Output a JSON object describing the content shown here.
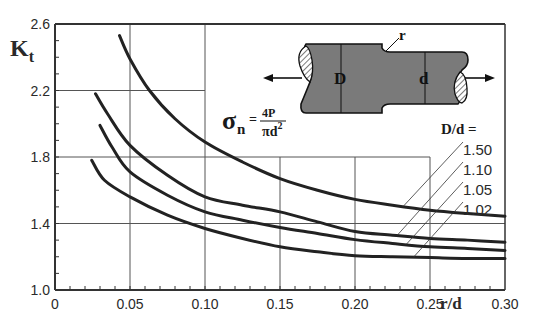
{
  "chart_data": {
    "type": "line",
    "title": "",
    "xlabel": "r/d",
    "ylabel": "K",
    "ylabel_subscript": "t",
    "xlim": [
      0,
      0.3
    ],
    "ylim": [
      1.0,
      2.6
    ],
    "x_ticks": [
      0,
      0.05,
      0.1,
      0.15,
      0.2,
      0.25,
      0.3
    ],
    "x_tick_labels": [
      "0",
      "0.05",
      "0.10",
      "0.15",
      "0.20",
      "0.25",
      "0.30"
    ],
    "y_ticks": [
      1.0,
      1.4,
      1.8,
      2.2,
      2.6
    ],
    "y_tick_labels": [
      "1.0",
      "1.4",
      "1.8",
      "2.2",
      "2.6"
    ],
    "x_minor_step": 0.01,
    "y_minor_step": 0.1,
    "grid": "partial",
    "gridlines": [
      {
        "orient": "v",
        "at": 0.05,
        "from": 1.0,
        "to": 2.6
      },
      {
        "orient": "v",
        "at": 0.1,
        "from": 1.0,
        "to": 2.6
      },
      {
        "orient": "v",
        "at": 0.15,
        "from": 1.0,
        "to": 1.8
      },
      {
        "orient": "v",
        "at": 0.2,
        "from": 1.0,
        "to": 1.8
      },
      {
        "orient": "v",
        "at": 0.25,
        "from": 1.0,
        "to": 1.8
      },
      {
        "orient": "h",
        "at": 2.2,
        "from": 0,
        "to": 0.1
      },
      {
        "orient": "h",
        "at": 1.8,
        "from": 0,
        "to": 0.25
      },
      {
        "orient": "h",
        "at": 1.4,
        "from": 0,
        "to": 0.3
      }
    ],
    "legend_title": "D/d =",
    "legend_placement": "right",
    "series": [
      {
        "name": "1.50",
        "points": [
          [
            0.043,
            2.53
          ],
          [
            0.05,
            2.39
          ],
          [
            0.063,
            2.2
          ],
          [
            0.08,
            2.03
          ],
          [
            0.1,
            1.89
          ],
          [
            0.125,
            1.77
          ],
          [
            0.15,
            1.67
          ],
          [
            0.175,
            1.6
          ],
          [
            0.2,
            1.545
          ],
          [
            0.225,
            1.51
          ],
          [
            0.25,
            1.48
          ],
          [
            0.275,
            1.46
          ],
          [
            0.3,
            1.444
          ]
        ]
      },
      {
        "name": "1.10",
        "points": [
          [
            0.027,
            2.18
          ],
          [
            0.035,
            2.06
          ],
          [
            0.05,
            1.87
          ],
          [
            0.075,
            1.69
          ],
          [
            0.1,
            1.56
          ],
          [
            0.125,
            1.51
          ],
          [
            0.15,
            1.47
          ],
          [
            0.175,
            1.41
          ],
          [
            0.2,
            1.352
          ],
          [
            0.225,
            1.33
          ],
          [
            0.25,
            1.31
          ],
          [
            0.275,
            1.3
          ],
          [
            0.3,
            1.287
          ]
        ]
      },
      {
        "name": "1.05",
        "points": [
          [
            0.03,
            1.99
          ],
          [
            0.038,
            1.86
          ],
          [
            0.05,
            1.71
          ],
          [
            0.075,
            1.57
          ],
          [
            0.1,
            1.47
          ],
          [
            0.125,
            1.42
          ],
          [
            0.15,
            1.376
          ],
          [
            0.175,
            1.34
          ],
          [
            0.2,
            1.303
          ],
          [
            0.225,
            1.28
          ],
          [
            0.25,
            1.26
          ],
          [
            0.275,
            1.25
          ],
          [
            0.3,
            1.238
          ]
        ]
      },
      {
        "name": "1.02",
        "points": [
          [
            0.0245,
            1.78
          ],
          [
            0.033,
            1.66
          ],
          [
            0.05,
            1.56
          ],
          [
            0.075,
            1.45
          ],
          [
            0.1,
            1.37
          ],
          [
            0.125,
            1.31
          ],
          [
            0.15,
            1.26
          ],
          [
            0.175,
            1.23
          ],
          [
            0.2,
            1.206
          ],
          [
            0.225,
            1.2
          ],
          [
            0.25,
            1.195
          ],
          [
            0.275,
            1.19
          ],
          [
            0.3,
            1.19
          ]
        ]
      }
    ],
    "annotations": {
      "formula_lhs": "σ",
      "formula_sub": "n",
      "formula_eq": "=",
      "formula_num": "4P",
      "formula_den": "πd",
      "formula_den_sup": "2"
    },
    "diagram": {
      "label_D": "D",
      "label_d": "d",
      "label_r": "r",
      "fill_color": "#7a7a7a"
    }
  },
  "colors": {
    "curve": "#222222",
    "grid": "#555555",
    "frame": "#333333"
  }
}
